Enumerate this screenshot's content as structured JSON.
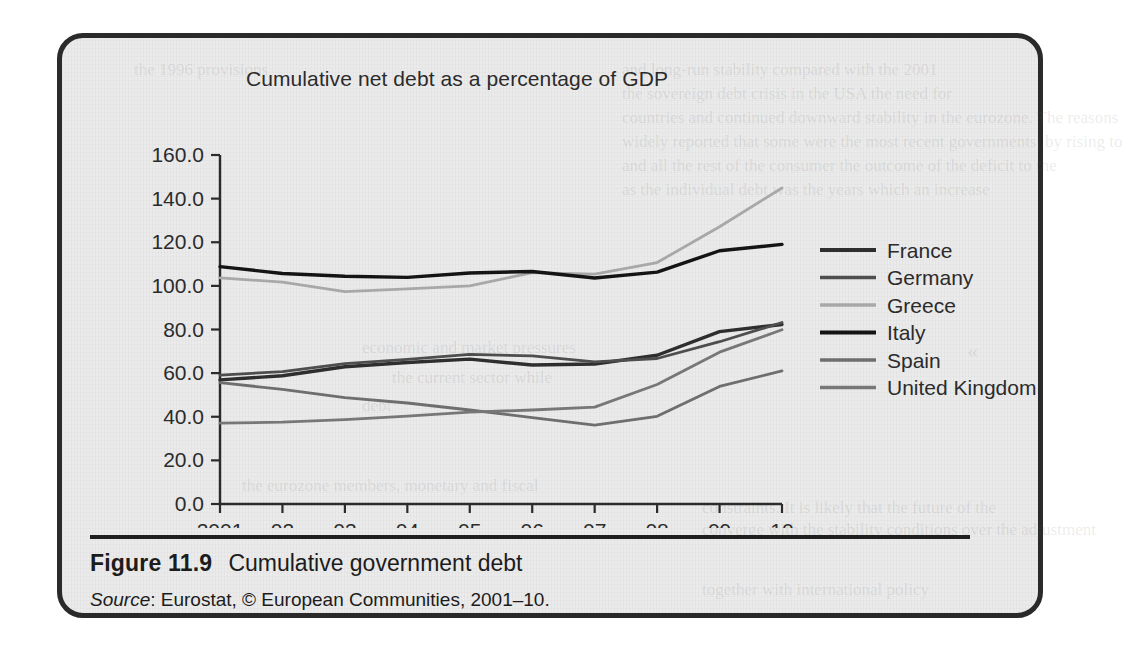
{
  "figure": {
    "caption_number": "Figure 11.9",
    "caption_text": "Cumulative government debt",
    "source_word": "Source",
    "source_text": ": Eurostat, © European Communities, 2001–10."
  },
  "chart_data": {
    "type": "line",
    "title": "Cumulative net debt as a percentage of GDP",
    "xlabel": "",
    "ylabel": "",
    "ylim": [
      0.0,
      160.0
    ],
    "yticks": [
      "0.0",
      "20.0",
      "40.0",
      "60.0",
      "80.0",
      "100.0",
      "120.0",
      "140.0",
      "160.0"
    ],
    "ytick_values": [
      0,
      20,
      40,
      60,
      80,
      100,
      120,
      140,
      160
    ],
    "grid": false,
    "legend_position": "right",
    "categories": [
      "2001",
      "02",
      "03",
      "04",
      "05",
      "06",
      "07",
      "08",
      "09",
      "10"
    ],
    "x_values": [
      2001,
      2002,
      2003,
      2004,
      2005,
      2006,
      2007,
      2008,
      2009,
      2010
    ],
    "series": [
      {
        "name": "France",
        "color": "#2e2e2e",
        "values": [
          56.9,
          58.8,
          62.9,
          64.9,
          66.4,
          63.7,
          64.2,
          68.2,
          79.0,
          82.3
        ]
      },
      {
        "name": "Germany",
        "color": "#4e4e4e",
        "values": [
          59.1,
          60.7,
          64.4,
          66.3,
          68.6,
          67.9,
          65.2,
          66.7,
          74.4,
          83.2
        ]
      },
      {
        "name": "Greece",
        "color": "#a8a8a8",
        "values": [
          103.7,
          101.7,
          97.4,
          98.6,
          100.0,
          106.1,
          105.4,
          110.7,
          127.1,
          144.9
        ]
      },
      {
        "name": "Italy",
        "color": "#141414",
        "values": [
          108.8,
          105.7,
          104.4,
          103.9,
          105.9,
          106.6,
          103.6,
          106.3,
          116.1,
          119.0
        ]
      },
      {
        "name": "Spain",
        "color": "#6e6e6e",
        "values": [
          55.6,
          52.6,
          48.8,
          46.3,
          43.1,
          39.6,
          36.2,
          40.2,
          53.9,
          61.0
        ]
      },
      {
        "name": "United Kingdom",
        "color": "#777777",
        "values": [
          37.1,
          37.5,
          38.7,
          40.3,
          42.1,
          43.1,
          44.4,
          54.8,
          69.6,
          79.9
        ]
      }
    ]
  },
  "bleed_text": {
    "lines": [
      "the 1996 provisions",
      "and long-run stability compared with the 2001",
      "the sovereign debt crisis in the USA the need for",
      "countries and continued downward stability in the eurozone. The reasons",
      "widely reported that some were the most recent governments, by rising to",
      "and all the rest of the consumer the outcome of the deficit to the",
      "as the individual debt was the years which an increase",
      "economic and market pressures",
      "the current sector while",
      "debt",
      "the eurozone members, monetary and fiscal",
      "constraints. It is likely that the future of the",
      "converge with the stability conditions over the adjustment",
      "together with international policy",
      "«"
    ]
  }
}
